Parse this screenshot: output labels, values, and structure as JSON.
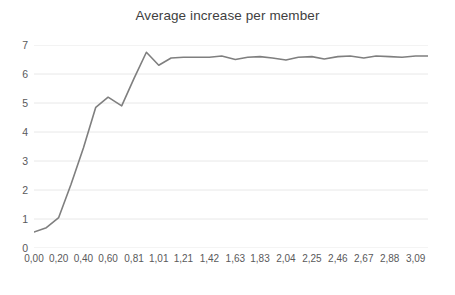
{
  "chart_data": {
    "type": "line",
    "title": "Average increase per member",
    "xlabel": "",
    "ylabel": "",
    "ylim": [
      0,
      7
    ],
    "yticks": [
      0,
      1,
      2,
      3,
      4,
      5,
      6,
      7
    ],
    "ytick_labels": [
      "0",
      "1",
      "2",
      "3",
      "4",
      "5",
      "6",
      "7"
    ],
    "xlim": [
      0.0,
      3.19
    ],
    "xtick_labels": [
      "0,00",
      "0,20",
      "0,40",
      "0,60",
      "0,81",
      "1,01",
      "1,21",
      "1,42",
      "1,63",
      "1,83",
      "2,04",
      "2,25",
      "2,46",
      "2,67",
      "2,88",
      "3,09"
    ],
    "xtick_values": [
      0.0,
      0.2,
      0.4,
      0.6,
      0.81,
      1.01,
      1.21,
      1.42,
      1.63,
      1.83,
      2.04,
      2.25,
      2.46,
      2.67,
      2.88,
      3.09
    ],
    "grid": true,
    "grid_axis": "y",
    "grid_color": "#e8e8e8",
    "legend": false,
    "legend_position": "none",
    "line_color": "#7f7f7f",
    "line_width": 1.6,
    "markers": false,
    "series": [
      {
        "name": "Average increase per member",
        "x": [
          0.0,
          0.1,
          0.2,
          0.3,
          0.4,
          0.5,
          0.6,
          0.71,
          0.81,
          0.91,
          1.01,
          1.11,
          1.21,
          1.31,
          1.42,
          1.52,
          1.63,
          1.73,
          1.83,
          1.93,
          2.04,
          2.14,
          2.25,
          2.35,
          2.46,
          2.56,
          2.67,
          2.77,
          2.88,
          2.98,
          3.09,
          3.19
        ],
        "values": [
          0.55,
          0.7,
          1.05,
          2.2,
          3.45,
          4.85,
          5.2,
          4.9,
          5.85,
          6.75,
          6.3,
          6.55,
          6.58,
          6.58,
          6.58,
          6.62,
          6.5,
          6.58,
          6.6,
          6.55,
          6.48,
          6.58,
          6.6,
          6.52,
          6.6,
          6.62,
          6.55,
          6.62,
          6.6,
          6.58,
          6.62,
          6.62
        ]
      }
    ]
  },
  "colors": {
    "background": "#ffffff",
    "title_text": "#3f3f3f",
    "tick_text": "#59595b",
    "gridline": "#e8e8e8",
    "line": "#7f7f7f"
  }
}
